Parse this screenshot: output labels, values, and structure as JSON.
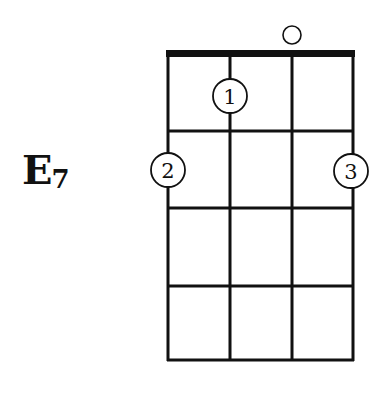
{
  "chord": {
    "root": "E",
    "extension": "7",
    "name": "E7"
  },
  "diagram": {
    "instrument": "ukulele",
    "strings": 4,
    "frets_shown": 4,
    "nut": true,
    "open_strings": [
      3
    ],
    "fingers": [
      {
        "finger": "1",
        "string": 2,
        "fret": 1
      },
      {
        "finger": "2",
        "string": 1,
        "fret": 2
      },
      {
        "finger": "3",
        "string": 4,
        "fret": 2
      }
    ],
    "colors": {
      "ink": "#111111",
      "background": "#ffffff"
    }
  }
}
